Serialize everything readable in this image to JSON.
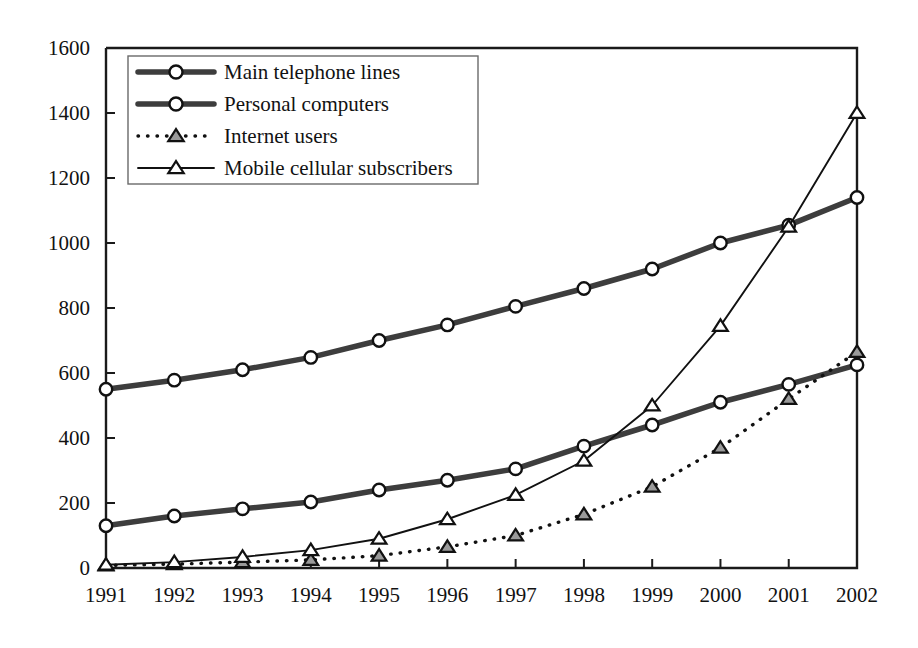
{
  "chart_data": {
    "type": "line",
    "title": "",
    "subtitle": "",
    "xlabel": "",
    "ylabel": "",
    "categories": [
      "1991",
      "1992",
      "1993",
      "1994",
      "1995",
      "1996",
      "1997",
      "1998",
      "1999",
      "2000",
      "2001",
      "2002"
    ],
    "x": [
      1991,
      1992,
      1993,
      1994,
      1995,
      1996,
      1997,
      1998,
      1999,
      2000,
      2001,
      2002
    ],
    "ylim": [
      0,
      1600
    ],
    "ytick_labels": [
      "0",
      "200",
      "400",
      "600",
      "800",
      "1000",
      "1200",
      "1400",
      "1600"
    ],
    "yticks": [
      0,
      200,
      400,
      600,
      800,
      1000,
      1200,
      1400,
      1600
    ],
    "grid": false,
    "legend_position": "top-left inside plot area",
    "series": [
      {
        "name": "Main telephone lines",
        "marker": "circle",
        "line_style": "thick-solid",
        "values": [
          550,
          578,
          610,
          648,
          700,
          748,
          805,
          860,
          920,
          1000,
          1055,
          1140
        ]
      },
      {
        "name": "Personal computers",
        "marker": "circle",
        "line_style": "thick-solid",
        "values": [
          130,
          160,
          182,
          203,
          240,
          270,
          305,
          375,
          440,
          510,
          565,
          625
        ]
      },
      {
        "name": "Internet users",
        "marker": "triangle-shaded",
        "line_style": "dotted",
        "values": [
          8,
          12,
          18,
          25,
          38,
          65,
          100,
          165,
          250,
          370,
          520,
          665
        ]
      },
      {
        "name": "Mobile cellular subscribers",
        "marker": "triangle-open",
        "line_style": "thin-solid",
        "values": [
          10,
          18,
          34,
          55,
          90,
          150,
          225,
          330,
          500,
          745,
          1050,
          1400
        ]
      }
    ]
  },
  "legend": {
    "items": [
      {
        "label": "Main telephone lines"
      },
      {
        "label": "Personal computers"
      },
      {
        "label": "Internet users"
      },
      {
        "label": "Mobile cellular subscribers"
      }
    ]
  },
  "colors": {
    "axis": "#1a1a1a",
    "thick_series": "#3d3d3d",
    "thin_series": "#111111",
    "marker_fill": "#ffffff",
    "shaded_marker_fill": "#9a9a9a",
    "background": "#ffffff"
  }
}
